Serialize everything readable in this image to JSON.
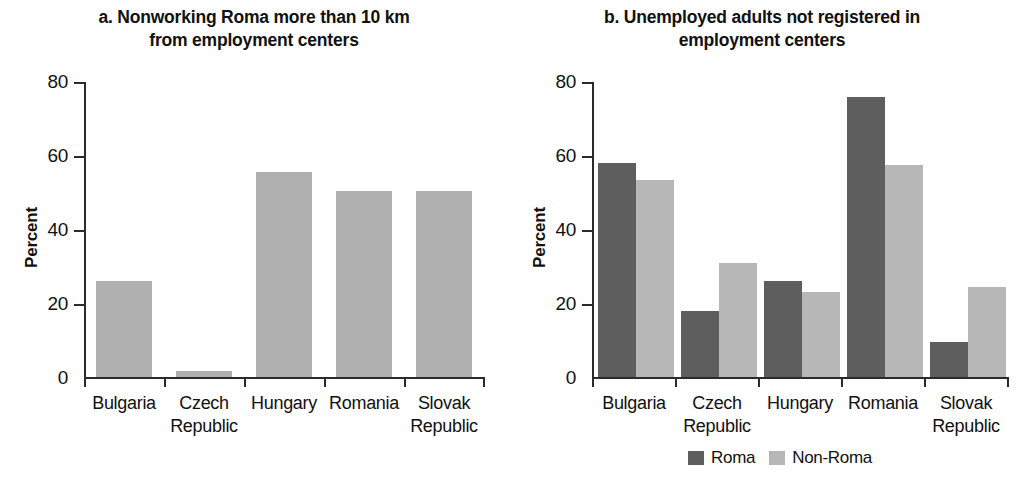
{
  "figure": {
    "background": "#ffffff",
    "colors": {
      "roma": "#5e5e5e",
      "non_roma": "#b7b7b7",
      "single_series": "#b0b0b0",
      "axis": "#2b2b2b",
      "text": "#111111"
    }
  },
  "panels": [
    {
      "id": "a",
      "title": "a. Nonworking Roma more than 10 km from employment centers",
      "title_line1": "a. Nonworking Roma more than 10 km",
      "title_line2": "from employment centers",
      "ylabel": "Percent",
      "yticks": [
        "80",
        "60",
        "40",
        "20",
        "0"
      ],
      "categories": [
        {
          "line1": "Bulgaria",
          "line2": ""
        },
        {
          "line1": "Czech",
          "line2": "Republic"
        },
        {
          "line1": "Hungary",
          "line2": ""
        },
        {
          "line1": "Romania",
          "line2": ""
        },
        {
          "line1": "Slovak",
          "line2": "Republic"
        }
      ]
    },
    {
      "id": "b",
      "title": "b. Unemployed adults not registered in employment centers",
      "title_line1": "b. Unemployed adults not registered in",
      "title_line2": "employment centers",
      "ylabel": "Percent",
      "yticks": [
        "80",
        "60",
        "40",
        "20",
        "0"
      ],
      "categories": [
        {
          "line1": "Bulgaria",
          "line2": ""
        },
        {
          "line1": "Czech",
          "line2": "Republic"
        },
        {
          "line1": "Hungary",
          "line2": ""
        },
        {
          "line1": "Romania",
          "line2": ""
        },
        {
          "line1": "Slovak",
          "line2": "Republic"
        }
      ],
      "legend": [
        {
          "label": "Roma",
          "color": "#5e5e5e"
        },
        {
          "label": "Non-Roma",
          "color": "#b7b7b7"
        }
      ]
    }
  ],
  "chart_data": [
    {
      "type": "bar",
      "title": "a. Nonworking Roma more than 10 km from employment centers",
      "xlabel": "",
      "ylabel": "Percent",
      "ylim": [
        0,
        80
      ],
      "yticks": [
        0,
        20,
        40,
        60,
        80
      ],
      "grid": false,
      "legend": null,
      "categories": [
        "Bulgaria",
        "Czech Republic",
        "Hungary",
        "Romania",
        "Slovak Republic"
      ],
      "values": [
        26,
        1.5,
        55.5,
        50.5,
        50.5
      ]
    },
    {
      "type": "bar",
      "title": "b. Unemployed adults not registered in employment centers",
      "xlabel": "",
      "ylabel": "Percent",
      "ylim": [
        0,
        80
      ],
      "yticks": [
        0,
        20,
        40,
        60,
        80
      ],
      "grid": false,
      "legend_position": "bottom",
      "categories": [
        "Bulgaria",
        "Czech Republic",
        "Hungary",
        "Romania",
        "Slovak Republic"
      ],
      "series": [
        {
          "name": "Roma",
          "color": "#5e5e5e",
          "values": [
            58,
            18,
            26,
            76,
            9.5
          ]
        },
        {
          "name": "Non-Roma",
          "color": "#b7b7b7",
          "values": [
            53.5,
            31,
            23,
            57.5,
            24.5
          ]
        }
      ]
    }
  ]
}
